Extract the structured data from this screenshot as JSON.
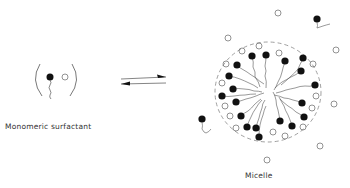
{
  "labels": {
    "monomer": "Monomeric surfactant",
    "micelle": "Micelle"
  },
  "colors": {
    "ink": "#111111",
    "line": "#555555",
    "dash": "#888888"
  },
  "equilibrium_arrow": "reversible-equilibrium"
}
